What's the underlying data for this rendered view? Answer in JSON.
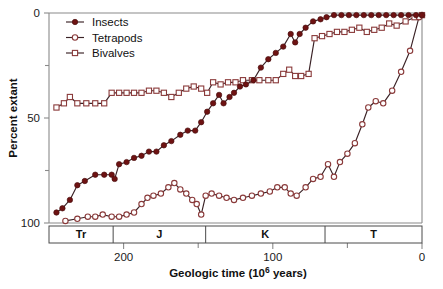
{
  "chart_data": {
    "type": "line",
    "title": "",
    "xlabel": "Geologic time (10⁶ years)",
    "ylabel": "Percent extant",
    "xlim": [
      250,
      0
    ],
    "ylim": [
      0,
      100
    ],
    "x_reversed": true,
    "grid": false,
    "legend_position": "top-left",
    "x_ticks": [
      200,
      100,
      0
    ],
    "x_minor_ticks": [
      150,
      50
    ],
    "y_ticks": [
      0,
      50,
      100
    ],
    "y_minor_ticks": [
      25,
      75
    ],
    "colors": {
      "insects_marker": "#6e1212",
      "tetrapods_marker": "#ffffff",
      "bivalves_marker": "#ffffff",
      "marker_edge": "#8a3a3a",
      "line": "#3a2226",
      "axis": "#8a8a8a",
      "text": "#111111"
    },
    "periods": [
      {
        "label": "Tr",
        "start": 250,
        "end": 207
      },
      {
        "label": "J",
        "start": 207,
        "end": 145
      },
      {
        "label": "K",
        "start": 145,
        "end": 65
      },
      {
        "label": "T",
        "start": 65,
        "end": 0
      }
    ],
    "series": [
      {
        "name": "Insects",
        "marker": "filled-circle",
        "points": [
          [
            245,
            5
          ],
          [
            241,
            7
          ],
          [
            236,
            11
          ],
          [
            231,
            18
          ],
          [
            226,
            20
          ],
          [
            219,
            23
          ],
          [
            213,
            23
          ],
          [
            208,
            23
          ],
          [
            206,
            21
          ],
          [
            203,
            28
          ],
          [
            198,
            29
          ],
          [
            193,
            31
          ],
          [
            188,
            32
          ],
          [
            183,
            34
          ],
          [
            178,
            34
          ],
          [
            173,
            37
          ],
          [
            168,
            39
          ],
          [
            162,
            42
          ],
          [
            157,
            44
          ],
          [
            152,
            44
          ],
          [
            148,
            48
          ],
          [
            144,
            53
          ],
          [
            140,
            57
          ],
          [
            136,
            61
          ],
          [
            133,
            57
          ],
          [
            129,
            60
          ],
          [
            126,
            62
          ],
          [
            122,
            65
          ],
          [
            118,
            66
          ],
          [
            113,
            68
          ],
          [
            108,
            74
          ],
          [
            103,
            78
          ],
          [
            98,
            81
          ],
          [
            93,
            84
          ],
          [
            88,
            90
          ],
          [
            85,
            86
          ],
          [
            82,
            90
          ],
          [
            78,
            93
          ],
          [
            73,
            96
          ],
          [
            68,
            97
          ],
          [
            64,
            98
          ],
          [
            59,
            99
          ],
          [
            54,
            99
          ],
          [
            49,
            99
          ],
          [
            44,
            99
          ],
          [
            39,
            99
          ],
          [
            34,
            99
          ],
          [
            29,
            99
          ],
          [
            24,
            99
          ],
          [
            19,
            99
          ],
          [
            14,
            99
          ],
          [
            9,
            99
          ],
          [
            4,
            99
          ],
          [
            0,
            99
          ]
        ]
      },
      {
        "name": "Tetrapods",
        "marker": "open-circle",
        "points": [
          [
            239,
            1
          ],
          [
            231,
            2
          ],
          [
            224,
            3
          ],
          [
            219,
            3
          ],
          [
            214,
            4
          ],
          [
            208,
            3
          ],
          [
            203,
            3
          ],
          [
            198,
            4
          ],
          [
            193,
            5
          ],
          [
            188,
            9
          ],
          [
            184,
            12
          ],
          [
            180,
            13
          ],
          [
            175,
            14
          ],
          [
            170,
            17
          ],
          [
            166,
            19
          ],
          [
            162,
            16
          ],
          [
            158,
            14
          ],
          [
            154,
            11
          ],
          [
            151,
            9
          ],
          [
            148,
            4
          ],
          [
            145,
            13
          ],
          [
            141,
            14
          ],
          [
            136,
            13
          ],
          [
            131,
            12
          ],
          [
            126,
            11
          ],
          [
            120,
            12
          ],
          [
            114,
            13
          ],
          [
            108,
            14
          ],
          [
            102,
            15
          ],
          [
            97,
            17
          ],
          [
            92,
            17
          ],
          [
            88,
            14
          ],
          [
            84,
            13
          ],
          [
            78,
            17
          ],
          [
            73,
            21
          ],
          [
            68,
            22
          ],
          [
            63,
            28
          ],
          [
            59,
            22
          ],
          [
            55,
            29
          ],
          [
            50,
            33
          ],
          [
            45,
            38
          ],
          [
            40,
            47
          ],
          [
            36,
            55
          ],
          [
            31,
            58
          ],
          [
            26,
            57
          ],
          [
            20,
            63
          ],
          [
            14,
            72
          ],
          [
            8,
            82
          ],
          [
            2,
            98
          ],
          [
            0,
            99
          ]
        ]
      },
      {
        "name": "Bivalves",
        "marker": "open-square",
        "points": [
          [
            245,
            55
          ],
          [
            240,
            57
          ],
          [
            236,
            60
          ],
          [
            231,
            57
          ],
          [
            225,
            57
          ],
          [
            219,
            57
          ],
          [
            213,
            57
          ],
          [
            208,
            62
          ],
          [
            203,
            62
          ],
          [
            198,
            62
          ],
          [
            193,
            62
          ],
          [
            188,
            62
          ],
          [
            183,
            63
          ],
          [
            178,
            63
          ],
          [
            173,
            62
          ],
          [
            168,
            60
          ],
          [
            163,
            62
          ],
          [
            158,
            64
          ],
          [
            153,
            65
          ],
          [
            148,
            64
          ],
          [
            144,
            62
          ],
          [
            140,
            67
          ],
          [
            135,
            66
          ],
          [
            130,
            67
          ],
          [
            125,
            67
          ],
          [
            120,
            68
          ],
          [
            114,
            68
          ],
          [
            109,
            68
          ],
          [
            103,
            68
          ],
          [
            98,
            68
          ],
          [
            93,
            71
          ],
          [
            89,
            73
          ],
          [
            85,
            70
          ],
          [
            81,
            70
          ],
          [
            76,
            71
          ],
          [
            72,
            88
          ],
          [
            67,
            89
          ],
          [
            62,
            90
          ],
          [
            57,
            91
          ],
          [
            52,
            91
          ],
          [
            47,
            92
          ],
          [
            42,
            93
          ],
          [
            37,
            91
          ],
          [
            32,
            92
          ],
          [
            27,
            93
          ],
          [
            22,
            95
          ],
          [
            17,
            94
          ],
          [
            11,
            96
          ],
          [
            5,
            98
          ],
          [
            0,
            99
          ]
        ]
      }
    ]
  },
  "legend": {
    "items": [
      {
        "label": "Insects"
      },
      {
        "label": "Tetrapods"
      },
      {
        "label": "Bivalves"
      }
    ]
  },
  "axis": {
    "y_title": "Percent extant",
    "x_title_main": "Geologic time (10",
    "x_title_sup": "6",
    "x_title_tail": " years)",
    "y_tick_labels": [
      "100",
      "50",
      "0"
    ],
    "x_tick_labels": [
      "200",
      "100",
      "0"
    ]
  }
}
